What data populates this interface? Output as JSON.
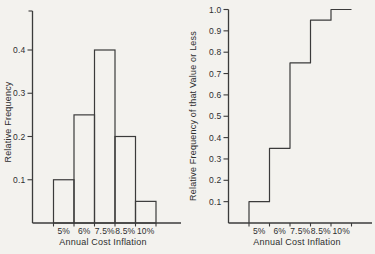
{
  "figure": {
    "background": "#f3f2ee",
    "line_color": "#3b3b3b",
    "text_color": "#2e2e2e",
    "bar_fill": "none"
  },
  "chart_data": [
    {
      "type": "bar",
      "title": "",
      "categories": [
        "5%",
        "6%",
        "7.5%",
        "8.5%",
        "10%"
      ],
      "values": [
        0.1,
        0.25,
        0.4,
        0.2,
        0.05
      ],
      "xlabel": "Annual Cost Inflation",
      "ylabel": "Relative Frequency",
      "ylim": [
        0,
        0.45
      ],
      "yticks": [
        0.1,
        0.2,
        0.3,
        0.4
      ],
      "ytick_labels": [
        "0.1",
        "0.2",
        "0.3",
        "0.4"
      ],
      "grid": false,
      "legend": "none"
    },
    {
      "type": "step",
      "title": "",
      "categories": [
        "5%",
        "6%",
        "7.5%",
        "8.5%",
        "10%"
      ],
      "values": [
        0.1,
        0.35,
        0.75,
        0.95,
        1.0
      ],
      "xlabel": "Annual Cost Inflation",
      "ylabel": "Relative Frequency of that Value or Less",
      "ylim": [
        0,
        1.0
      ],
      "yticks": [
        0.1,
        0.2,
        0.3,
        0.4,
        0.5,
        0.6,
        0.7,
        0.8,
        0.9,
        1.0
      ],
      "ytick_labels": [
        "0.1",
        "0.2",
        "0.3",
        "0.4",
        "0.5",
        "0.6",
        "0.7",
        "0.8",
        "0.9",
        "1.0"
      ],
      "grid": false,
      "legend": "none"
    }
  ]
}
